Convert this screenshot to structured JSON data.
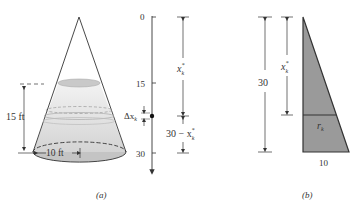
{
  "figure_a": {
    "caption": "(a)",
    "height_label": "15 ft",
    "radius_label": "10 ft",
    "axis_ticks": [
      "0",
      "15",
      "30"
    ],
    "delta_label": "Δx",
    "delta_sub": "k",
    "upper_label": "x",
    "upper_sub": "k",
    "upper_sup": "*",
    "lower_label_prefix": "30 − x",
    "lower_sub": "k",
    "lower_sup": "*"
  },
  "figure_b": {
    "caption": "(b)",
    "height_label": "30",
    "upper_label": "x",
    "upper_sub": "k",
    "upper_sup": "*",
    "radius_label": "r",
    "radius_sub": "k",
    "base_label": "10"
  },
  "colors": {
    "triangle_fill": "#9a9a9a",
    "line": "#333333",
    "liquid_top": "#c8c8c8"
  }
}
